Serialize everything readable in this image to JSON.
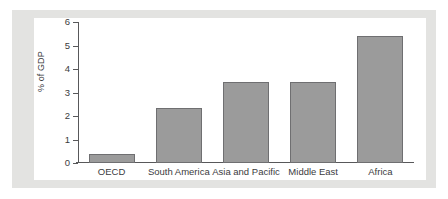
{
  "chart_data": {
    "type": "bar",
    "title": "",
    "subtitle": "",
    "xlabel": "",
    "ylabel": "% of GDP",
    "categories": [
      "OECD",
      "South America",
      "Asia and Pacific",
      "Middle East",
      "Africa"
    ],
    "values": [
      0.4,
      2.35,
      3.45,
      3.45,
      5.4
    ],
    "ylim": [
      0,
      6
    ],
    "ytick_labels": [
      "0",
      "1",
      "2",
      "3",
      "4",
      "5",
      "6"
    ],
    "ytick_values": [
      0,
      1,
      2,
      3,
      4,
      5,
      6
    ],
    "grid": false,
    "legend": null,
    "legend_position": "none",
    "annotations": []
  },
  "colors": {
    "bar_fill": "#9b9b9b",
    "bar_edge": "#6f6f71",
    "axis": "#58585a",
    "panel_background": "#e3e3e1",
    "plot_background": "#ffffff",
    "text": "#3b3b3d"
  }
}
